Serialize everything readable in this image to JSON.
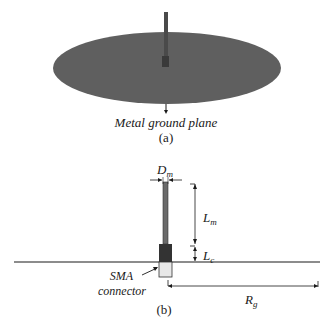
{
  "figure_a": {
    "label": "Metal ground plane",
    "caption": "(a)"
  },
  "figure_b": {
    "caption": "(b)",
    "dimensions": {
      "dm": {
        "main": "D",
        "sub": "m"
      },
      "lm": {
        "main": "L",
        "sub": "m"
      },
      "lc": {
        "main": "L",
        "sub": "c"
      },
      "rg": {
        "main": "R",
        "sub": "g"
      }
    },
    "connector_label_line1": "SMA",
    "connector_label_line2": "connector"
  },
  "colors": {
    "ground_plane": "#5f5f5f",
    "monopole": "#4a4a4a",
    "connector_dark": "#333333",
    "connector_light": "#e8e8e8",
    "line": "#1a1a1a"
  }
}
